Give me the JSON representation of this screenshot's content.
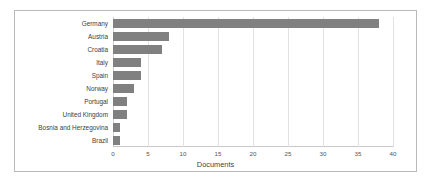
{
  "figure": {
    "border_color": "#b9b9b9",
    "background": "#ffffff"
  },
  "chart_data": {
    "type": "bar",
    "orientation": "horizontal",
    "title": "",
    "subtitle": "",
    "xlabel": "Documents",
    "ylabel": "",
    "categories": [
      "Germany",
      "Austria",
      "Croatia",
      "Italy",
      "Spain",
      "Norway",
      "Portugal",
      "United Kingdom",
      "Bosnia and Herzegovina",
      "Brazil"
    ],
    "values": [
      38,
      8,
      7,
      4,
      4,
      3,
      2,
      2,
      1,
      1
    ],
    "xlim": [
      0,
      40
    ],
    "xticks": [
      0,
      5,
      10,
      15,
      20,
      25,
      30,
      35,
      40
    ],
    "xtick_labels": [
      "0",
      "5",
      "10",
      "15",
      "20",
      "25",
      "30",
      "35",
      "40"
    ],
    "grid": "vertical",
    "legend": "none",
    "bar_color": "#808080",
    "gridline_color": "#e2e2e2"
  }
}
